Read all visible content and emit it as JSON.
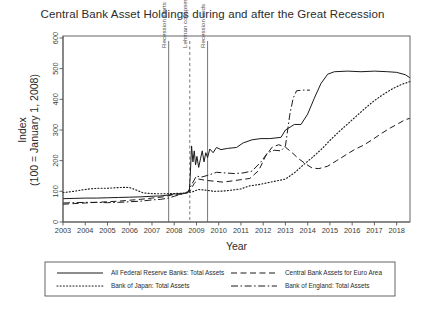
{
  "chart_data": {
    "type": "line",
    "title": "Central Bank Asset Holdings during and after the Great Recession",
    "xlabel": "Year",
    "ylabel_line1": "Index",
    "ylabel_line2": "(100 = January 1, 2008)",
    "xlim": [
      2003,
      2018.6
    ],
    "ylim": [
      0,
      600
    ],
    "xticks": [
      2003,
      2004,
      2005,
      2006,
      2007,
      2008,
      2009,
      2010,
      2011,
      2012,
      2013,
      2014,
      2015,
      2016,
      2017,
      2018
    ],
    "xticklabels": [
      "2003",
      "2004",
      "2005",
      "2006",
      "2007",
      "2008",
      "2009",
      "2010",
      "2011",
      "2012",
      "2013",
      "2014",
      "2015",
      "2016",
      "2017",
      "2018"
    ],
    "yticks": [
      0,
      100,
      200,
      300,
      400,
      500,
      600
    ],
    "yticklabels": [
      "0",
      "100",
      "200",
      "300",
      "400",
      "500",
      "600"
    ],
    "grid": false,
    "legend_position": "below-plot",
    "annotations": [
      {
        "label": "Recession starts",
        "x": 2007.75,
        "style": "solid"
      },
      {
        "label": "Lehman collapses",
        "x": 2008.7,
        "style": "dashed"
      },
      {
        "label": "Recession ends",
        "x": 2009.5,
        "style": "solid"
      }
    ],
    "series": [
      {
        "name": "All Federal Reserve Banks: Total Assets",
        "style": "solid",
        "points": [
          [
            2003.0,
            76
          ],
          [
            2003.5,
            77
          ],
          [
            2004.0,
            78
          ],
          [
            2004.5,
            78
          ],
          [
            2005.0,
            79
          ],
          [
            2005.5,
            80
          ],
          [
            2006.0,
            81
          ],
          [
            2006.5,
            82
          ],
          [
            2007.0,
            84
          ],
          [
            2007.4,
            85
          ],
          [
            2007.75,
            88
          ],
          [
            2008.0,
            92
          ],
          [
            2008.2,
            90
          ],
          [
            2008.45,
            93
          ],
          [
            2008.6,
            96
          ],
          [
            2008.68,
            100
          ],
          [
            2008.72,
            150
          ],
          [
            2008.78,
            248
          ],
          [
            2008.84,
            196
          ],
          [
            2008.9,
            232
          ],
          [
            2008.96,
            186
          ],
          [
            2009.02,
            214
          ],
          [
            2009.1,
            178
          ],
          [
            2009.18,
            206
          ],
          [
            2009.26,
            232
          ],
          [
            2009.34,
            196
          ],
          [
            2009.42,
            226
          ],
          [
            2009.5,
            210
          ],
          [
            2009.6,
            238
          ],
          [
            2009.75,
            226
          ],
          [
            2009.9,
            243
          ],
          [
            2010.1,
            236
          ],
          [
            2010.4,
            240
          ],
          [
            2010.8,
            243
          ],
          [
            2011.1,
            258
          ],
          [
            2011.5,
            268
          ],
          [
            2011.9,
            272
          ],
          [
            2012.3,
            272
          ],
          [
            2012.8,
            276
          ],
          [
            2013.0,
            300
          ],
          [
            2013.4,
            318
          ],
          [
            2013.7,
            318
          ],
          [
            2014.0,
            352
          ],
          [
            2014.3,
            404
          ],
          [
            2014.6,
            452
          ],
          [
            2014.9,
            482
          ],
          [
            2015.2,
            490
          ],
          [
            2015.8,
            492
          ],
          [
            2016.4,
            490
          ],
          [
            2017.0,
            492
          ],
          [
            2017.6,
            490
          ],
          [
            2018.0,
            488
          ],
          [
            2018.4,
            480
          ],
          [
            2018.6,
            470
          ]
        ]
      },
      {
        "name": "Central Bank Assets for Euro Area",
        "style": "dashed",
        "points": [
          [
            2003.0,
            58
          ],
          [
            2003.5,
            60
          ],
          [
            2004.0,
            62
          ],
          [
            2004.5,
            64
          ],
          [
            2005.0,
            66
          ],
          [
            2005.5,
            68
          ],
          [
            2006.0,
            71
          ],
          [
            2006.5,
            74
          ],
          [
            2007.0,
            78
          ],
          [
            2007.5,
            82
          ],
          [
            2007.75,
            86
          ],
          [
            2008.0,
            90
          ],
          [
            2008.4,
            94
          ],
          [
            2008.7,
            100
          ],
          [
            2008.9,
            126
          ],
          [
            2009.1,
            140
          ],
          [
            2009.4,
            136
          ],
          [
            2009.8,
            133
          ],
          [
            2010.2,
            130
          ],
          [
            2010.6,
            134
          ],
          [
            2011.0,
            138
          ],
          [
            2011.4,
            142
          ],
          [
            2011.8,
            168
          ],
          [
            2012.1,
            214
          ],
          [
            2012.4,
            244
          ],
          [
            2012.7,
            252
          ],
          [
            2013.0,
            244
          ],
          [
            2013.3,
            226
          ],
          [
            2013.6,
            206
          ],
          [
            2013.9,
            190
          ],
          [
            2014.2,
            176
          ],
          [
            2014.5,
            174
          ],
          [
            2014.9,
            182
          ],
          [
            2015.3,
            200
          ],
          [
            2015.7,
            218
          ],
          [
            2016.1,
            236
          ],
          [
            2016.5,
            250
          ],
          [
            2016.9,
            268
          ],
          [
            2017.3,
            288
          ],
          [
            2017.7,
            306
          ],
          [
            2018.1,
            322
          ],
          [
            2018.4,
            334
          ],
          [
            2018.6,
            338
          ]
        ]
      },
      {
        "name": "Bank of Japan: Total Assets",
        "style": "dotted",
        "points": [
          [
            2003.0,
            96
          ],
          [
            2003.4,
            99
          ],
          [
            2003.8,
            104
          ],
          [
            2004.2,
            108
          ],
          [
            2004.6,
            110
          ],
          [
            2005.0,
            110
          ],
          [
            2005.4,
            112
          ],
          [
            2005.8,
            113
          ],
          [
            2006.0,
            112
          ],
          [
            2006.3,
            104
          ],
          [
            2006.6,
            95
          ],
          [
            2006.9,
            93
          ],
          [
            2007.2,
            92
          ],
          [
            2007.6,
            92
          ],
          [
            2008.0,
            93
          ],
          [
            2008.4,
            94
          ],
          [
            2008.8,
            98
          ],
          [
            2009.1,
            106
          ],
          [
            2009.4,
            104
          ],
          [
            2009.8,
            100
          ],
          [
            2010.2,
            101
          ],
          [
            2010.6,
            104
          ],
          [
            2011.0,
            108
          ],
          [
            2011.4,
            118
          ],
          [
            2011.8,
            122
          ],
          [
            2012.2,
            128
          ],
          [
            2012.6,
            134
          ],
          [
            2013.0,
            140
          ],
          [
            2013.4,
            160
          ],
          [
            2013.8,
            186
          ],
          [
            2014.2,
            210
          ],
          [
            2014.6,
            236
          ],
          [
            2015.0,
            266
          ],
          [
            2015.4,
            294
          ],
          [
            2015.8,
            320
          ],
          [
            2016.2,
            346
          ],
          [
            2016.6,
            372
          ],
          [
            2017.0,
            396
          ],
          [
            2017.4,
            416
          ],
          [
            2017.8,
            434
          ],
          [
            2018.2,
            448
          ],
          [
            2018.6,
            458
          ]
        ]
      },
      {
        "name": "Bank of England: Total Assets",
        "style": "dashdot",
        "points": [
          [
            2003.0,
            62
          ],
          [
            2003.5,
            63
          ],
          [
            2004.0,
            64
          ],
          [
            2004.5,
            64
          ],
          [
            2005.0,
            63
          ],
          [
            2005.5,
            64
          ],
          [
            2006.0,
            66
          ],
          [
            2006.5,
            68
          ],
          [
            2007.0,
            72
          ],
          [
            2007.4,
            74
          ],
          [
            2007.75,
            78
          ],
          [
            2008.0,
            84
          ],
          [
            2008.3,
            90
          ],
          [
            2008.6,
            96
          ],
          [
            2008.8,
            124
          ],
          [
            2009.0,
            150
          ],
          [
            2009.2,
            146
          ],
          [
            2009.5,
            152
          ],
          [
            2009.9,
            162
          ],
          [
            2010.3,
            160
          ],
          [
            2010.7,
            158
          ],
          [
            2011.1,
            160
          ],
          [
            2011.5,
            166
          ],
          [
            2011.9,
            196
          ],
          [
            2012.2,
            226
          ],
          [
            2012.5,
            234
          ],
          [
            2012.8,
            232
          ],
          [
            2013.0,
            248
          ],
          [
            2013.1,
            300
          ],
          [
            2013.2,
            352
          ],
          [
            2013.35,
            404
          ],
          [
            2013.5,
            428
          ],
          [
            2013.8,
            430
          ],
          [
            2014.1,
            430
          ]
        ]
      }
    ]
  },
  "legend": {
    "entries": [
      {
        "label": "All Federal Reserve Banks: Total Assets",
        "style": "solid"
      },
      {
        "label": "Central Bank Assets for Euro Area",
        "style": "dashed"
      },
      {
        "label": "Bank of Japan: Total Assets",
        "style": "dotted"
      },
      {
        "label": "Bank of England: Total Assets",
        "style": "dashdot"
      }
    ]
  }
}
